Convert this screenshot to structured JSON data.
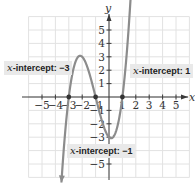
{
  "chart_data": {
    "type": "line",
    "title": "",
    "function": "f(x) = (x+3)(x+1)(x-1)",
    "xlabel": "x",
    "ylabel": "y",
    "xlim": [
      -6,
      6
    ],
    "ylim": [
      -6,
      6
    ],
    "grid": true,
    "x_ticks": [
      -5,
      -4,
      -3,
      -2,
      -1,
      1,
      2,
      3,
      4,
      5
    ],
    "x_tick_labels": [
      "−5",
      "−4",
      "−3",
      "−2",
      "−1",
      "1",
      "2",
      "3",
      "4",
      "5"
    ],
    "y_ticks": [
      5,
      4,
      3,
      2,
      1,
      -1,
      -2,
      -3,
      -5
    ],
    "y_tick_labels": [
      "5",
      "4",
      "3",
      "2",
      "1",
      "−1",
      "−2",
      "−3",
      "−5"
    ],
    "series": [
      {
        "name": "curve",
        "x": [
          -3.55,
          -3.3,
          -3.0,
          -2.7,
          -2.4,
          -2.15,
          -1.9,
          -1.6,
          -1.3,
          -1.0,
          -0.7,
          -0.4,
          -0.1,
          0.15,
          0.4,
          0.7,
          1.0,
          1.3,
          1.6,
          1.75
        ],
        "y": [
          -4.8,
          -2.2,
          0.0,
          1.7,
          2.8,
          3.08,
          2.9,
          2.2,
          1.2,
          0.0,
          -1.1,
          -2.3,
          -2.9,
          -3.08,
          -2.9,
          -2.2,
          0.0,
          2.6,
          6.7,
          8.6
        ]
      }
    ],
    "marked_points": [
      {
        "x": -3,
        "y": 0
      },
      {
        "x": -1,
        "y": 0
      },
      {
        "x": 1,
        "y": 0
      }
    ],
    "annotations": [
      {
        "prefix": "x",
        "text": "-intercept: −3",
        "target": {
          "x": -3,
          "y": 0
        }
      },
      {
        "prefix": "x",
        "text": "-intercept: 1",
        "target": {
          "x": 1,
          "y": 0
        }
      },
      {
        "prefix": "x",
        "text": "-intercept: −1",
        "target": {
          "x": -1,
          "y": 0
        }
      }
    ],
    "colors": {
      "curve": "#8c8c8c",
      "axes": "#3a3a3a",
      "grid": "#e2e2e2",
      "annotation_bg": "#e9e9e9"
    }
  }
}
